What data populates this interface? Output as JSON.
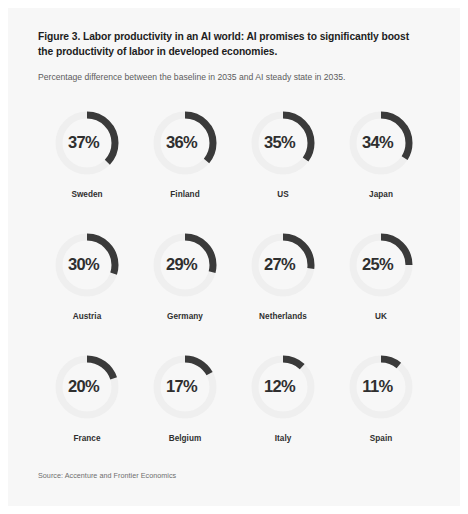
{
  "figure": {
    "title": "Figure 3. Labor productivity in an AI world: AI promises to significantly boost the productivity of labor in developed economies.",
    "subtitle": "Percentage difference between the baseline in 2035 and AI steady state in 2035.",
    "source": "Source: Accenture and Frontier Economics"
  },
  "colors": {
    "arc": "#3a3a3a",
    "track": "#efefef",
    "card_background": "#f7f7f7",
    "value_text": "#2f2f2f",
    "label_text": "#2f2f2f",
    "subtitle_text": "#5c5c5c",
    "source_text": "#6e6e6e"
  },
  "chart_data": {
    "type": "pie",
    "title": "Figure 3. Labor productivity in an AI world: AI promises to significantly boost the productivity of labor in developed economies.",
    "subtitle": "Percentage difference between the baseline in 2035 and AI steady state in 2035.",
    "xlabel": "",
    "ylabel": "Percentage difference (%)",
    "unit": "%",
    "grid": false,
    "legend": "none",
    "layout": "4 columns x 3 rows of donut gauges",
    "arc_start_angle_deg": 0,
    "arc_direction": "clockwise",
    "arc_sweep_rule": "sweep_degrees = value_percent / 100 * 360",
    "categories": [
      "Sweden",
      "Finland",
      "US",
      "Japan",
      "Austria",
      "Germany",
      "Netherlands",
      "UK",
      "France",
      "Belgium",
      "Italy",
      "Spain"
    ],
    "values": [
      37,
      36,
      35,
      34,
      30,
      29,
      27,
      25,
      20,
      17,
      12,
      11
    ],
    "ylim": [
      0,
      100
    ],
    "items": [
      {
        "label": "Sweden",
        "value": 37,
        "display": "37%"
      },
      {
        "label": "Finland",
        "value": 36,
        "display": "36%"
      },
      {
        "label": "US",
        "value": 35,
        "display": "35%"
      },
      {
        "label": "Japan",
        "value": 34,
        "display": "34%"
      },
      {
        "label": "Austria",
        "value": 30,
        "display": "30%"
      },
      {
        "label": "Germany",
        "value": 29,
        "display": "29%"
      },
      {
        "label": "Netherlands",
        "value": 27,
        "display": "27%"
      },
      {
        "label": "UK",
        "value": 25,
        "display": "25%"
      },
      {
        "label": "France",
        "value": 20,
        "display": "20%"
      },
      {
        "label": "Belgium",
        "value": 17,
        "display": "17%"
      },
      {
        "label": "Italy",
        "value": 12,
        "display": "12%"
      },
      {
        "label": "Spain",
        "value": 11,
        "display": "11%"
      }
    ]
  }
}
